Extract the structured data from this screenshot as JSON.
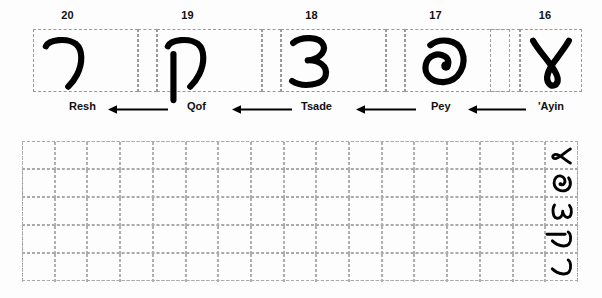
{
  "worksheet": {
    "title": "Samaritan letter writing practice worksheet",
    "script_direction": "right-to-left",
    "ink_color": "#000000",
    "grid_line_color": "#aaaaaa",
    "background_color": "#ffffff"
  },
  "chart": {
    "row_label": "letter chart",
    "letters": [
      {
        "number": "20",
        "name": "Resh",
        "glyph": "resh-glyph"
      },
      {
        "number": "19",
        "name": "Qof",
        "glyph": "qof-glyph"
      },
      {
        "number": "18",
        "name": "Tsade",
        "glyph": "tsade-glyph"
      },
      {
        "number": "17",
        "name": "Pey",
        "glyph": "pey-glyph"
      },
      {
        "number": "16",
        "name": "'Ayin",
        "glyph": "ayin-glyph"
      }
    ],
    "arrows": [
      {
        "name": "arrow-left-1",
        "direction": "left"
      },
      {
        "name": "arrow-left-2",
        "direction": "left"
      },
      {
        "name": "arrow-left-3",
        "direction": "left"
      },
      {
        "name": "arrow-left-4",
        "direction": "left"
      }
    ]
  },
  "practice": {
    "rows": 5,
    "columns": 17,
    "model_column_position": "right",
    "model_letters": [
      {
        "row": 1,
        "name": "'Ayin",
        "glyph": "ayin-glyph"
      },
      {
        "row": 2,
        "name": "Pey",
        "glyph": "pey-glyph"
      },
      {
        "row": 3,
        "name": "Tsade",
        "glyph": "tsade-glyph"
      },
      {
        "row": 4,
        "name": "Qof",
        "glyph": "qof-glyph"
      },
      {
        "row": 5,
        "name": "Resh",
        "glyph": "resh-glyph"
      }
    ]
  }
}
